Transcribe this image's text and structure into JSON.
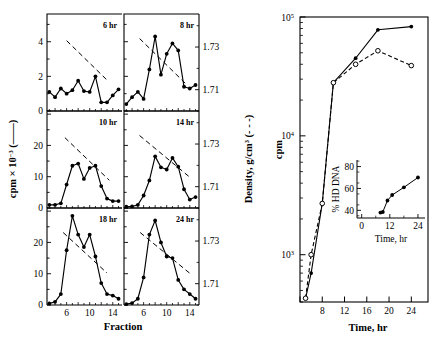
{
  "figure": {
    "name": "density-gradient-and-kinetics-figure",
    "left_panel": {
      "y_axis_label_main": "cpm × 10",
      "y_axis_label_exp": "−3",
      "y_axis_label_tail": "(——)",
      "y_axis_label_full": "cpm × 10⁻³ (——)",
      "right_axis_label": "Density, g/cm",
      "right_axis_label_exp": "3",
      "right_axis_label_tail": "(- - -)",
      "right_axis_label_full": "Density, g/cm³ (- - -)",
      "x_axis_label": "Fraction",
      "x_ticks": [
        "6",
        "10",
        "14"
      ],
      "density_ticks": [
        "1.73",
        "1.71"
      ],
      "panels": [
        {
          "label": "6 hr",
          "row": 0,
          "col": 0,
          "y_ticks": [
            "0",
            "2",
            "4"
          ],
          "y_max": 5.6,
          "fraction_x": [
            3,
            4,
            5,
            6,
            7,
            8,
            9,
            10,
            11,
            12,
            13,
            14,
            15
          ],
          "cpm": [
            1.1,
            0.8,
            1.3,
            1.0,
            1.2,
            1.75,
            1.15,
            1.1,
            2.0,
            0.5,
            0.5,
            0.9,
            1.25
          ],
          "density_line": {
            "x1": 6,
            "y1": 1.733,
            "x2": 13.2,
            "y2": 1.714
          }
        },
        {
          "label": "8 hr",
          "row": 0,
          "col": 1,
          "y_max": 5.6,
          "fraction_x": [
            3,
            4,
            5,
            6,
            7,
            8,
            9,
            10,
            11,
            12,
            13,
            14,
            15
          ],
          "cpm": [
            0.4,
            0.8,
            1.1,
            0.7,
            2.4,
            4.3,
            2.1,
            3.3,
            3.9,
            3.5,
            1.4,
            1.3,
            1.5
          ],
          "density_line": {
            "x1": 5.3,
            "y1": 1.734,
            "x2": 13.6,
            "y2": 1.712
          }
        },
        {
          "label": "10 hr",
          "row": 1,
          "col": 0,
          "y_ticks": [
            "0",
            "10",
            "20"
          ],
          "y_max": 31,
          "fraction_x": [
            3,
            4,
            5,
            6,
            7,
            8,
            9,
            10,
            11,
            12,
            13,
            14,
            15
          ],
          "cpm": [
            1.0,
            1.0,
            1.5,
            7.5,
            13.5,
            14.2,
            9.3,
            12.8,
            13.5,
            7.0,
            3.0,
            2.2,
            2.2
          ],
          "density_line": {
            "x1": 5.7,
            "y1": 1.733,
            "x2": 13.4,
            "y2": 1.713
          }
        },
        {
          "label": "14 hr",
          "row": 1,
          "col": 1,
          "y_max": 31,
          "fraction_x": [
            3,
            4,
            5,
            6,
            7,
            8,
            9,
            10,
            11,
            12,
            13,
            14,
            15
          ],
          "cpm": [
            0.4,
            0.5,
            1.0,
            4.0,
            8.8,
            16.5,
            13.0,
            12.3,
            16.0,
            13.2,
            6.0,
            2.7,
            3.5
          ],
          "density_line": {
            "x1": 5.3,
            "y1": 1.734,
            "x2": 14.2,
            "y2": 1.714
          }
        },
        {
          "label": "18 hr",
          "row": 2,
          "col": 0,
          "y_ticks": [
            "0",
            "10",
            "20"
          ],
          "y_max": 31,
          "fraction_x": [
            3,
            4,
            5,
            6,
            7,
            8,
            9,
            10,
            11,
            12,
            13,
            14,
            15
          ],
          "cpm": [
            0.5,
            1.0,
            3.5,
            17.5,
            28.5,
            22.5,
            18.5,
            22.5,
            15.5,
            7.0,
            3.5,
            3.0,
            2.0
          ],
          "density_line": {
            "x1": 5.4,
            "y1": 1.734,
            "x2": 13.0,
            "y2": 1.715
          }
        },
        {
          "label": "24 hr",
          "row": 2,
          "col": 1,
          "y_max": 31,
          "fraction_x": [
            3,
            4,
            5,
            6,
            7,
            8,
            9,
            10,
            11,
            12,
            13,
            14,
            15
          ],
          "cpm": [
            0.3,
            0.6,
            2.0,
            8.8,
            22.5,
            27.0,
            20.0,
            15.5,
            15.0,
            8.0,
            5.0,
            3.5,
            2.0
          ],
          "density_line": {
            "x1": 5.4,
            "y1": 1.734,
            "x2": 14.4,
            "y2": 1.714
          }
        }
      ]
    },
    "right_panel": {
      "y_axis_label": "cpm",
      "x_axis_label": "Time, hr",
      "y_ticks": [
        "10",
        "10"
      ],
      "y_tick_exps": [
        "5",
        "4"
      ],
      "y_tick_low_exp": "3",
      "y_min": 400,
      "y_max": 100000,
      "x_ticks": [
        "8",
        "12",
        "16",
        "20",
        "24"
      ],
      "x_min": 4,
      "x_max": 27,
      "series": [
        {
          "name": "filled-circles-solid",
          "marker": "filled-circle",
          "line_style": "solid",
          "x": [
            5,
            6,
            8,
            10,
            14,
            18,
            24
          ],
          "y": [
            430,
            700,
            2700,
            28000,
            45000,
            78000,
            83000
          ]
        },
        {
          "name": "open-circles-dashed",
          "marker": "open-circle",
          "line_style": "dashed",
          "x": [
            5,
            6,
            8,
            10,
            14,
            18,
            24
          ],
          "y": [
            430,
            1000,
            2700,
            28000,
            40000,
            52000,
            39000
          ]
        }
      ]
    },
    "inset": {
      "y_axis_label": "% HD DNA",
      "x_axis_label": "Time, hr",
      "y_ticks": [
        "40",
        "60",
        "80"
      ],
      "x_ticks": [
        "0",
        "12",
        "24"
      ],
      "x_min": -2,
      "x_max": 27,
      "y_min": 33,
      "y_max": 86,
      "series": {
        "name": "hd-dna-percent",
        "marker": "filled-circle",
        "x": [
          8,
          9,
          11,
          13,
          18,
          24
        ],
        "y": [
          38,
          38.5,
          49,
          54,
          61,
          70
        ]
      }
    }
  }
}
